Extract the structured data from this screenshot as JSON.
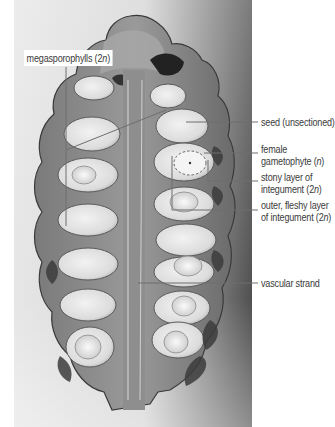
{
  "figure": {
    "labels": {
      "megasporophylls": {
        "text": "megasporophylls (2",
        "ploidy": "n",
        "close": ")"
      },
      "seed": {
        "text": "seed (unsectioned)"
      },
      "female_gametophyte": {
        "line1": "female",
        "line2": "gametophyte (",
        "ploidy": "n",
        "close": ")"
      },
      "stony_layer": {
        "line1": "stony layer of",
        "line2": "integument (2",
        "ploidy": "n",
        "close": ")"
      },
      "fleshy_layer": {
        "line1": "outer, fleshy layer",
        "line2": "of integument (2",
        "ploidy": "n",
        "close": ")"
      },
      "vascular_strand": {
        "text": "vascular strand"
      }
    },
    "colors": {
      "label_text": "#3a3a3a",
      "leader_line": "#6e6e6e",
      "background": "#ffffff",
      "photo_background_light": "#e4e4e4",
      "photo_background_dark": "#5a5a5a",
      "cone_tissue": "#8c8c8c",
      "seed_light": "#e8e8e8"
    }
  }
}
